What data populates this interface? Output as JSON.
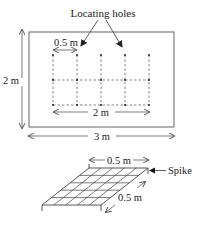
{
  "diagram": {
    "top_figure": {
      "title_label": "Locating holes",
      "height_label": "2 m",
      "width_label": "3 m",
      "spacing_label": "0.5 m",
      "grid_span_label": "2 m"
    },
    "bottom_figure": {
      "top_width_label": "0.5 m",
      "depth_label": "0.5 m",
      "spike_label": "Spike"
    },
    "colors": {
      "line": "#333333",
      "text": "#222222",
      "background": "#ffffff"
    }
  }
}
